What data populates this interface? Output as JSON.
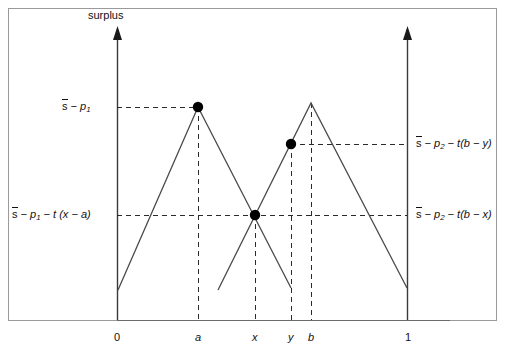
{
  "figure": {
    "type": "line-diagram",
    "axis_title": "surplus",
    "frame": {
      "x": 8,
      "y": 8,
      "width": 489,
      "height": 313
    },
    "plot": {
      "origin_x": 117,
      "baseline_y": 320,
      "right_axis_x": 408,
      "y_top": 30
    }
  },
  "x_axis": {
    "ticks": [
      {
        "label": "0",
        "italic": false,
        "px": 117
      },
      {
        "label": "a",
        "italic": true,
        "px": 198
      },
      {
        "label": "x",
        "italic": true,
        "px": 255
      },
      {
        "label": "y",
        "italic": true,
        "px": 291
      },
      {
        "label": "b",
        "italic": true,
        "px": 311
      },
      {
        "label": "1",
        "italic": false,
        "px": 408
      }
    ]
  },
  "y_labels_left": [
    {
      "id": "s-minus-p1",
      "text": "s̄ − p₁",
      "px_y": 107
    },
    {
      "id": "s-minus-p1-minus-t-x-minus-a",
      "text": "s̄ − p₁ − t (x − a)",
      "px_y": 215
    }
  ],
  "y_labels_right": [
    {
      "id": "s-minus-p2-minus-t-b-minus-y",
      "text": "s̄ − p₂ − t(b − y)",
      "px_y": 144
    },
    {
      "id": "s-minus-p2-minus-t-b-minus-x",
      "text": "s̄ − p₂ − t(b − x)",
      "px_y": 215
    }
  ],
  "chart_data": {
    "type": "line",
    "title": "",
    "xlabel": "",
    "ylabel": "surplus",
    "xlim": [
      0,
      1
    ],
    "grid": false,
    "legend": null,
    "series": [
      {
        "name": "firm-1-surplus",
        "comment": "tent peaking at a",
        "points_px": [
          [
            118,
            290
          ],
          [
            198,
            107
          ],
          [
            291,
            288
          ]
        ]
      },
      {
        "name": "firm-2-surplus",
        "comment": "tent peaking at b",
        "points_px": [
          [
            218,
            290
          ],
          [
            311,
            103
          ],
          [
            407,
            288
          ]
        ]
      }
    ],
    "markers": [
      {
        "name": "peak-a-dot",
        "px": [
          198,
          107
        ],
        "r": 5
      },
      {
        "name": "intersection-x-dot",
        "px": [
          255,
          215
        ],
        "r": 5
      },
      {
        "name": "point-y-dot",
        "px": [
          291,
          144
        ],
        "r": 5
      }
    ],
    "dashed_horizontals": [
      {
        "name": "dash-level-s-p1",
        "y": 107,
        "x1": 117,
        "x2": 198
      },
      {
        "name": "dash-level-t-b-minus-y",
        "y": 144,
        "x1": 291,
        "x2": 408
      },
      {
        "name": "dash-level-t-x-minus-a",
        "y": 215,
        "x1": 117,
        "x2": 408
      }
    ],
    "dashed_verticals": [
      {
        "name": "dash-vert-a",
        "x": 198,
        "y1": 107,
        "y2": 320
      },
      {
        "name": "dash-vert-x",
        "x": 255,
        "y1": 215,
        "y2": 320
      },
      {
        "name": "dash-vert-y",
        "x": 291,
        "y1": 144,
        "y2": 320
      },
      {
        "name": "dash-vert-b",
        "x": 311,
        "y1": 103,
        "y2": 320
      }
    ]
  },
  "colors": {
    "ink": "#111111",
    "line": "#4a4a4a",
    "frame": "#8c8c8c",
    "background": "#ffffff"
  }
}
